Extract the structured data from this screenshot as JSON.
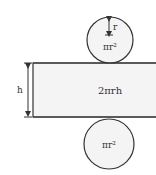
{
  "diagram": {
    "top_circle": {
      "label": "πr²",
      "radius_label": "r"
    },
    "rectangle": {
      "label": "2πrh",
      "height_label": "h"
    },
    "bottom_circle": {
      "label": "πr²"
    },
    "colors": {
      "stroke": "#333333",
      "fill": "#f4f4f4",
      "background": "#ffffff"
    }
  }
}
